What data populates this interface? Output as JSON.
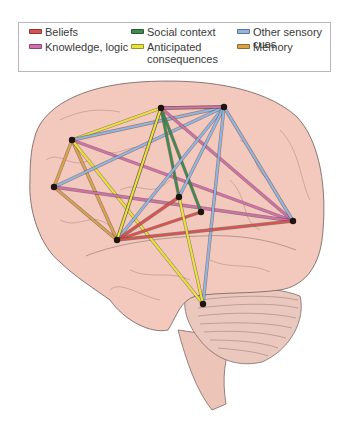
{
  "legend": {
    "items": [
      {
        "label": "Beliefs",
        "color": "#d9534f",
        "x": 10,
        "y": 3
      },
      {
        "label": "Knowledge, logic",
        "color": "#d36fae",
        "x": 10,
        "y": 18
      },
      {
        "label": "Social context",
        "color": "#3f8a4f",
        "x": 112,
        "y": 3
      },
      {
        "label": "Anticipated consequences",
        "color": "#e8e23a",
        "x": 112,
        "y": 18
      },
      {
        "label": "Other sensory cues",
        "color": "#8fb6e3",
        "x": 218,
        "y": 3
      },
      {
        "label": "Memory",
        "color": "#dba24a",
        "x": 218,
        "y": 18
      }
    ]
  },
  "diagram": {
    "nodes": [
      {
        "id": "L1",
        "x": 72,
        "y": 140
      },
      {
        "id": "L2",
        "x": 54,
        "y": 187
      },
      {
        "id": "A",
        "x": 161,
        "y": 108
      },
      {
        "id": "B",
        "x": 224,
        "y": 107
      },
      {
        "id": "C",
        "x": 117,
        "y": 240
      },
      {
        "id": "D",
        "x": 179,
        "y": 197
      },
      {
        "id": "E",
        "x": 201,
        "y": 212
      },
      {
        "id": "R",
        "x": 293,
        "y": 221
      },
      {
        "id": "F",
        "x": 203,
        "y": 304
      }
    ],
    "edges": [
      {
        "from": "A",
        "to": "B",
        "type": "Anticipated consequences"
      },
      {
        "from": "L1",
        "to": "A",
        "type": "Anticipated consequences"
      },
      {
        "from": "L1",
        "to": "B",
        "type": "Other sensory cues"
      },
      {
        "from": "L1",
        "to": "R",
        "type": "Knowledge, logic"
      },
      {
        "from": "L1",
        "to": "L2",
        "type": "Memory"
      },
      {
        "from": "L1",
        "to": "C",
        "type": "Memory"
      },
      {
        "from": "L2",
        "to": "C",
        "type": "Memory"
      },
      {
        "from": "L1",
        "to": "F",
        "type": "Anticipated consequences"
      },
      {
        "from": "L2",
        "to": "B",
        "type": "Other sensory cues"
      },
      {
        "from": "L2",
        "to": "R",
        "type": "Knowledge, logic"
      },
      {
        "from": "A",
        "to": "C",
        "type": "Social context"
      },
      {
        "from": "A",
        "to": "D",
        "type": "Social context"
      },
      {
        "from": "A",
        "to": "E",
        "type": "Social context"
      },
      {
        "from": "A",
        "to": "R",
        "type": "Knowledge, logic"
      },
      {
        "from": "B",
        "to": "C",
        "type": "Other sensory cues"
      },
      {
        "from": "B",
        "to": "D",
        "type": "Other sensory cues"
      },
      {
        "from": "B",
        "to": "F",
        "type": "Other sensory cues"
      },
      {
        "from": "B",
        "to": "R",
        "type": "Other sensory cues"
      },
      {
        "from": "B",
        "to": "A",
        "type": "Knowledge, logic"
      },
      {
        "from": "C",
        "to": "D",
        "type": "Beliefs"
      },
      {
        "from": "C",
        "to": "E",
        "type": "Beliefs"
      },
      {
        "from": "C",
        "to": "R",
        "type": "Beliefs"
      },
      {
        "from": "D",
        "to": "F",
        "type": "Anticipated consequences"
      },
      {
        "from": "C",
        "to": "A",
        "type": "Anticipated consequences"
      }
    ]
  }
}
